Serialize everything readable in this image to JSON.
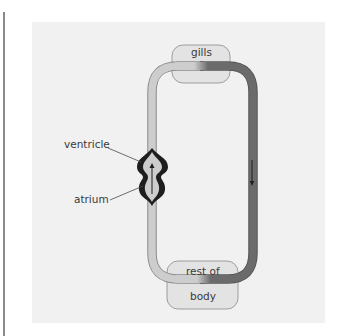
{
  "diagram": {
    "nodes": {
      "gills": "gills",
      "body_line1": "rest of",
      "body_line2": "body"
    },
    "labels": {
      "ventricle": "ventricle",
      "atrium": "atrium"
    },
    "colors": {
      "panel": "#f1f1f1",
      "deoxygenated_vessel": "#cdcdcd",
      "oxygenated_vessel": "#6b6b6b",
      "heart_wall": "#1e1e1e",
      "organ_box": "#e3e3e3"
    },
    "flow": {
      "heart_arrow": "up",
      "right_vessel_arrow": "down"
    }
  }
}
